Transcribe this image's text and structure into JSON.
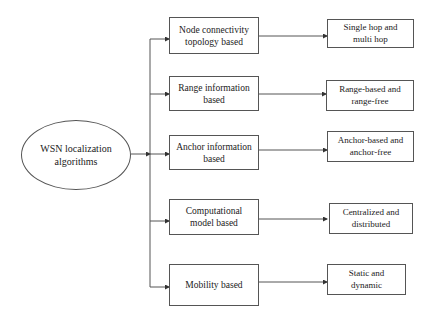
{
  "root": {
    "label": "WSN localization algorithms",
    "line1": "WSN localization",
    "line2": "algorithms"
  },
  "categories": [
    {
      "label": "Node connectivity topology based",
      "line1": "Node connectivity",
      "line2": "topology based",
      "result": {
        "label": "Single hop and multi hop",
        "line1": "Single hop and",
        "line2": "multi hop"
      }
    },
    {
      "label": "Range information based",
      "line1": "Range information",
      "line2": "based",
      "result": {
        "label": "Range-based and range-free",
        "line1": "Range-based and",
        "line2": "range-free"
      }
    },
    {
      "label": "Anchor information based",
      "line1": "Anchor information",
      "line2": "based",
      "result": {
        "label": "Anchor-based and anchor-free",
        "line1": "Anchor-based and",
        "line2": "anchor-free"
      }
    },
    {
      "label": "Computational model based",
      "line1": "Computational",
      "line2": "model based",
      "result": {
        "label": "Centralized and distributed",
        "line1": "Centralized and",
        "line2": "distributed"
      }
    },
    {
      "label": "Mobility based",
      "line1": "Mobility based",
      "line2": "",
      "result": {
        "label": "Static and dynamic",
        "line1": "Static and",
        "line2": "dynamic"
      }
    }
  ],
  "colors": {
    "stroke": "#555555",
    "text": "#222222",
    "background": "#ffffff"
  }
}
